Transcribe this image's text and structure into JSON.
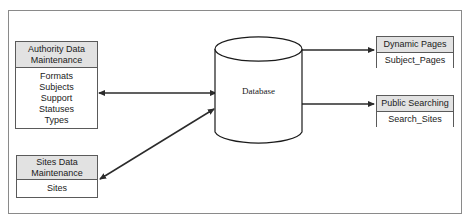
{
  "diagram": {
    "frame": {
      "border_color": "#8a8a8a"
    },
    "colors": {
      "header_fill": "#e2e2e2",
      "box_border": "#5a5a5a",
      "body_fill": "#ffffff",
      "connector": "#2b2b2b",
      "frame_border": "#8a8a8a"
    },
    "boxes": {
      "authority": {
        "header": "Authority\nData Maintenance",
        "header_line1": "Authority",
        "header_line2": "Data Maintenance",
        "items": [
          "Formats",
          "Subjects",
          "Support",
          "Statuses",
          "Types"
        ]
      },
      "sites": {
        "header_line1": "Sites Data",
        "header_line2": "Maintenance",
        "items": [
          "Sites"
        ]
      },
      "dynamic_pages": {
        "header": "Dynamic Pages",
        "items": [
          "Subject_Pages"
        ]
      },
      "public_searching": {
        "header": "Public Searching",
        "items": [
          "Search_Sites"
        ]
      }
    },
    "datastore": {
      "label": "Database",
      "shape": "cylinder"
    },
    "connectors": [
      {
        "name": "authority-to-database",
        "from": "Authority Data Maintenance",
        "to": "Database",
        "direction": "bidirectional"
      },
      {
        "name": "sites-to-database",
        "from": "Sites Data Maintenance",
        "to": "Database",
        "direction": "bidirectional"
      },
      {
        "name": "database-to-dynamic-pages",
        "from": "Database",
        "to": "Dynamic Pages",
        "direction": "unidirectional"
      },
      {
        "name": "database-to-public-searching",
        "from": "Database",
        "to": "Public Searching",
        "direction": "unidirectional"
      }
    ]
  }
}
